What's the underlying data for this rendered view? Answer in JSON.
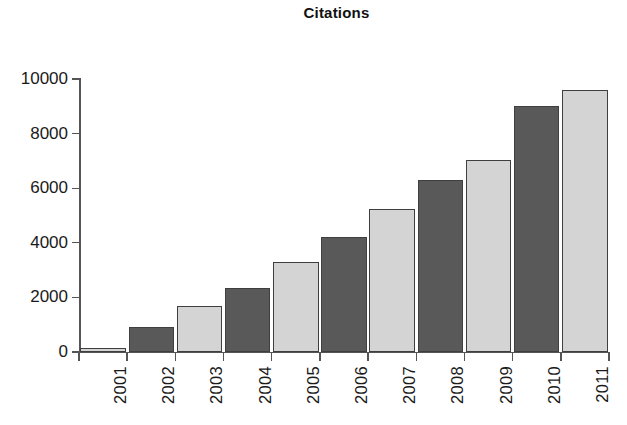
{
  "chart_data": {
    "type": "bar",
    "title": "Citations",
    "xlabel": "",
    "ylabel": "",
    "categories": [
      "2001",
      "2002",
      "2003",
      "2004",
      "2005",
      "2006",
      "2007",
      "2008",
      "2009",
      "2010",
      "2011"
    ],
    "values": [
      150,
      930,
      1670,
      2330,
      3300,
      4200,
      5250,
      6300,
      7050,
      9000,
      9600
    ],
    "bar_colors": [
      "#d4d4d4",
      "#595959",
      "#d4d4d4",
      "#595959",
      "#d4d4d4",
      "#595959",
      "#d4d4d4",
      "#595959",
      "#d4d4d4",
      "#595959",
      "#d4d4d4"
    ],
    "bar_border_color": "#3f3f3f",
    "ylim": [
      0,
      10000
    ],
    "yticks": [
      0,
      2000,
      4000,
      6000,
      8000,
      10000
    ],
    "ytick_labels": [
      "0",
      "2000",
      "4000",
      "6000",
      "8000",
      "10000"
    ],
    "xtick_label_rotation": 90,
    "grid": false,
    "legend": "none",
    "axis_color": "#555555",
    "background": "#ffffff"
  }
}
